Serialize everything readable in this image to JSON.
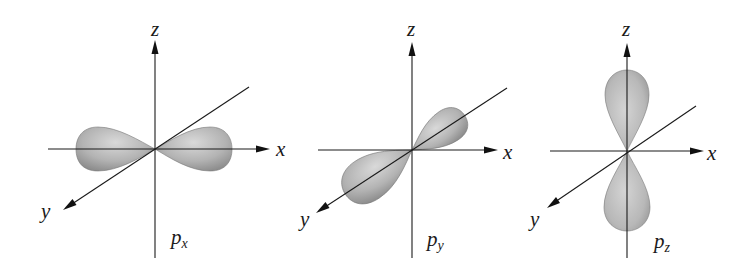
{
  "figure": {
    "panels": [
      {
        "name": "p-x orbital",
        "orbital_letter": "p",
        "orbital_subscript": "x",
        "lobe_axis": "x",
        "axis_labels": {
          "z": "z",
          "x": "x",
          "y": "y"
        }
      },
      {
        "name": "p-y orbital",
        "orbital_letter": "p",
        "orbital_subscript": "y",
        "lobe_axis": "y",
        "axis_labels": {
          "z": "z",
          "x": "x",
          "y": "y"
        }
      },
      {
        "name": "p-z orbital",
        "orbital_letter": "p",
        "orbital_subscript": "z",
        "lobe_axis": "z",
        "axis_labels": {
          "z": "z",
          "x": "x",
          "y": "y"
        }
      }
    ],
    "colors": {
      "lobe_light": "#d6d6d6",
      "lobe_dark": "#8c8c8c",
      "axis": "#1a1a1a",
      "background": "#ffffff"
    }
  }
}
